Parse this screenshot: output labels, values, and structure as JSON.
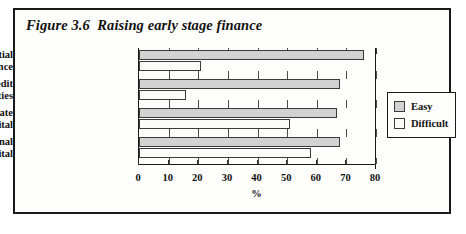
{
  "figure": {
    "title": "Figure 3.6  Raising early stage finance"
  },
  "legend": {
    "position": "right",
    "items": [
      {
        "label": "Easy",
        "color": "#d2d2d2"
      },
      {
        "label": "Difficult",
        "color": "#fbfbf8"
      }
    ]
  },
  "chart_data": {
    "type": "bar",
    "orientation": "horizontal",
    "title": "Figure 3.6  Raising early stage finance",
    "xlabel": "%",
    "ylabel": "",
    "xlim": [
      0,
      80
    ],
    "xticks": [
      0,
      10,
      20,
      30,
      40,
      50,
      60,
      70,
      80
    ],
    "xtick_labels": [
      "0",
      "10",
      "20",
      "30",
      "40",
      "50",
      "60",
      "70",
      "80"
    ],
    "grid": false,
    "legend_position": "right",
    "categories": [
      "Raising initial finance",
      "Obtaining credit facilities",
      "Maintaining adequate working capital",
      "Raising additional working capital"
    ],
    "category_lines": [
      [
        "Raising initial",
        "finance"
      ],
      [
        "Obtaining credit",
        "facilities"
      ],
      [
        "Maintaining adequate",
        "working capital"
      ],
      [
        "Raising additional",
        "working capital"
      ]
    ],
    "series": [
      {
        "name": "Easy",
        "color": "#d2d2d2",
        "values": [
          76,
          68,
          67,
          68
        ]
      },
      {
        "name": "Difficult",
        "color": "#fbfbf8",
        "values": [
          21,
          16,
          51,
          58
        ]
      }
    ]
  }
}
